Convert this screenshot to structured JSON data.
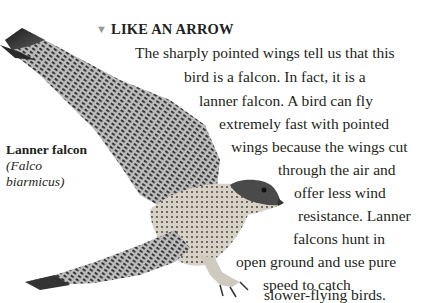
{
  "heading": {
    "marker": "▼",
    "title": "LIKE AN ARROW"
  },
  "body_lines": [
    "The sharply pointed wings tell us that this",
    "bird is a falcon. In fact, it is a",
    "lanner falcon. A bird can fly",
    "extremely fast with pointed",
    "wings because the wings cut",
    "through the air and",
    "offer less wind",
    "resistance. Lanner",
    "falcons hunt in",
    "open ground and use pure",
    "speed to catch",
    "slower-flying birds."
  ],
  "caption": {
    "common_name": "Lanner falcon",
    "latin_open": "(",
    "latin_name": "Falco biarmicus",
    "latin_line1": "(Falco",
    "latin_line2": "biarmicus)"
  },
  "image": {
    "subject": "lanner-falcon-in-flight"
  }
}
